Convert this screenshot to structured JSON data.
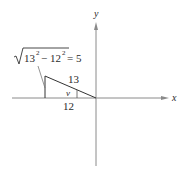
{
  "diagram": {
    "axes": {
      "x_label": "x",
      "y_label": "y"
    },
    "triangle": {
      "hypotenuse_label": "13",
      "adjacent_label": "12",
      "angle_label": "v",
      "opposite_value": 5
    },
    "formula": {
      "radicand_a": "13",
      "radicand_b": "12",
      "exponent": "2",
      "operator": "−",
      "equals": "= 5"
    },
    "colors": {
      "axis": "#8a8a8a",
      "triangle": "#333333",
      "text": "#2a2a2a"
    }
  }
}
